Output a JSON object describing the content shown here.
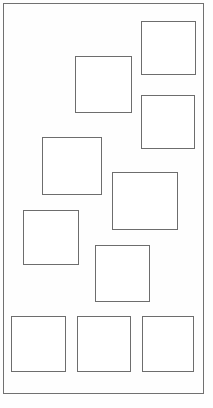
{
  "diagram": {
    "canvas": {
      "width": 213,
      "height": 408,
      "background": "#fefefe"
    },
    "frame": {
      "name": "outer-rectangle",
      "x": 3,
      "y": 3,
      "width": 201,
      "height": 391,
      "stroke": "#707070",
      "stroke_width": 1,
      "fill": "none"
    },
    "style": {
      "square_stroke": "#6d6d6d",
      "square_stroke_width": 1,
      "square_fill": "#ffffff"
    },
    "shape_count": 10,
    "shapes": [
      {
        "id": 1,
        "name": "square-top-right",
        "x": 141,
        "y": 21,
        "width": 55,
        "height": 54
      },
      {
        "id": 2,
        "name": "square-upper-center",
        "x": 75,
        "y": 56,
        "width": 57,
        "height": 57
      },
      {
        "id": 3,
        "name": "square-right-upper-mid",
        "x": 141,
        "y": 95,
        "width": 54,
        "height": 54
      },
      {
        "id": 4,
        "name": "square-left-middle",
        "x": 42,
        "y": 137,
        "width": 60,
        "height": 58
      },
      {
        "id": 5,
        "name": "square-center",
        "x": 112,
        "y": 172,
        "width": 66,
        "height": 58
      },
      {
        "id": 6,
        "name": "square-left-lower-mid",
        "x": 23,
        "y": 210,
        "width": 56,
        "height": 55
      },
      {
        "id": 7,
        "name": "square-center-lower",
        "x": 95,
        "y": 245,
        "width": 55,
        "height": 57
      },
      {
        "id": 8,
        "name": "square-bottom-left",
        "x": 11,
        "y": 316,
        "width": 55,
        "height": 56
      },
      {
        "id": 9,
        "name": "square-bottom-center",
        "x": 77,
        "y": 316,
        "width": 54,
        "height": 56
      },
      {
        "id": 10,
        "name": "square-bottom-right",
        "x": 142,
        "y": 316,
        "width": 52,
        "height": 56
      }
    ]
  }
}
